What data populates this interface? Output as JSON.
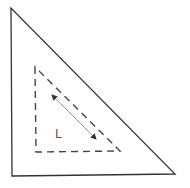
{
  "diagram": {
    "background": "#ffffff",
    "outer_triangle": {
      "points": [
        [
          11,
          8
        ],
        [
          12,
          176
        ],
        [
          175,
          174
        ]
      ],
      "stroke": "#333333",
      "stroke_width": 1.3,
      "style": "solid"
    },
    "inner_triangle": {
      "points": [
        [
          35,
          67
        ],
        [
          36,
          152
        ],
        [
          120,
          151
        ]
      ],
      "stroke": "#444444",
      "stroke_width": 1.4,
      "style": "dashed",
      "dash": "7,5"
    },
    "arrow": {
      "from": [
        52,
        95
      ],
      "to": [
        96,
        139
      ],
      "stroke": "#999999",
      "head_color": "#333333",
      "double_headed": true
    },
    "label": {
      "text": "L",
      "x": 55,
      "y": 138,
      "color": "#555555"
    }
  }
}
